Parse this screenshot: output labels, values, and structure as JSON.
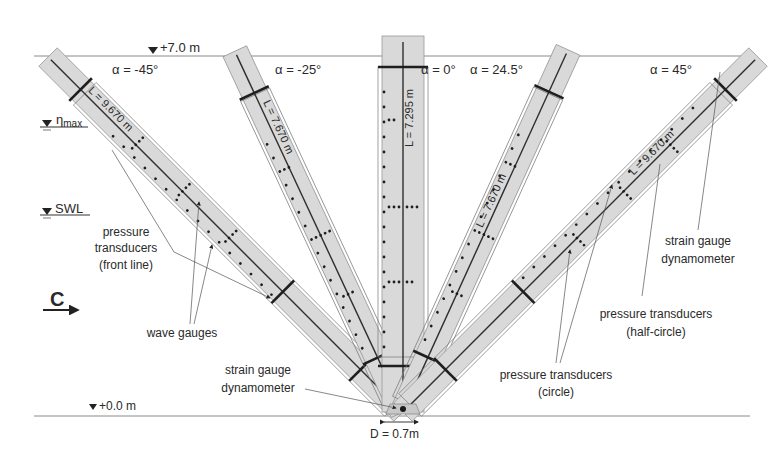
{
  "levels": {
    "top": {
      "label": "+7.0 m",
      "y": 56
    },
    "eta_max": {
      "label": "η",
      "sub": "max"
    },
    "swl": {
      "label": "SWL"
    },
    "bottom": {
      "label": "+0.0 m",
      "y": 416
    }
  },
  "current": {
    "label": "C"
  },
  "piles": [
    {
      "id": "alpha-minus-45",
      "angle_label": "α = -45°",
      "length_label": "L = 9.670 m",
      "angle_deg": -45,
      "length_m": 9.67
    },
    {
      "id": "alpha-minus-25",
      "angle_label": "α = -25°",
      "length_label": "L = 7.670 m",
      "angle_deg": -25,
      "length_m": 7.67
    },
    {
      "id": "alpha-0",
      "angle_label": "α = 0°",
      "length_label": "L = 7.295 m",
      "angle_deg": 0,
      "length_m": 7.295
    },
    {
      "id": "alpha-24-5",
      "angle_label": "α = 24.5°",
      "length_label": "L = 7.670 m",
      "angle_deg": 24.5,
      "length_m": 7.67
    },
    {
      "id": "alpha-45",
      "angle_label": "α = 45°",
      "length_label": "L = 9.670 m",
      "angle_deg": 45,
      "length_m": 9.67
    }
  ],
  "annotations": {
    "pt_front_1": "pressure",
    "pt_front_2": "transducers",
    "pt_front_3": "(front line)",
    "wave_gauges": "wave gauges",
    "sg_left_1": "strain gauge",
    "sg_left_2": "dynamometer",
    "sg_right_1": "strain gauge",
    "sg_right_2": "dynamometer",
    "pt_half_1": "pressure transducers",
    "pt_half_2": "(half-circle)",
    "pt_circle_1": "pressure transducers",
    "pt_circle_2": "(circle)",
    "diameter": "D = 0.7m"
  },
  "colors": {
    "pile_fill": "#d9d9d9",
    "line": "#2e2e2e",
    "text": "#2a2a2a"
  }
}
